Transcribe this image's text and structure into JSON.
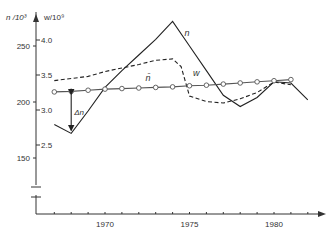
{
  "chart_data": {
    "type": "line",
    "title": "",
    "xlabel": "",
    "ylabel_left": "n /10³",
    "ylabel_right": "w/10⁹",
    "x_ticks": [
      1970,
      1975,
      1980
    ],
    "x_range": [
      1967,
      1983
    ],
    "y_left_ticks": [
      150,
      200,
      250
    ],
    "y_left_range": [
      130,
      275
    ],
    "y_right_ticks": [
      "2.5",
      "3.0",
      "3.5",
      "4.0"
    ],
    "axis_break": true,
    "grid": false,
    "legend": "inline labels",
    "series": [
      {
        "name": "n",
        "label": "n",
        "style": "solid",
        "axis": "left",
        "x": [
          1967,
          1968,
          1969,
          1970,
          1971,
          1972,
          1973,
          1974,
          1975,
          1976,
          1977,
          1978,
          1979,
          1980,
          1981,
          1982
        ],
        "values": [
          180,
          172,
          192,
          213,
          228,
          242,
          256,
          272,
          250,
          228,
          206,
          196,
          204,
          218,
          217,
          202
        ]
      },
      {
        "name": "w",
        "label": "w",
        "style": "dashed",
        "axis": "right",
        "x": [
          1967,
          1968,
          1969,
          1970,
          1971,
          1972,
          1973,
          1974,
          1974.5,
          1975,
          1976,
          1977,
          1978,
          1979,
          1980,
          1981
        ],
        "values": [
          3.42,
          3.45,
          3.48,
          3.55,
          3.6,
          3.65,
          3.71,
          3.73,
          3.62,
          3.2,
          3.12,
          3.1,
          3.16,
          3.25,
          3.4,
          3.36
        ]
      },
      {
        "name": "n_bar",
        "label": "n̄",
        "style": "solid-with-circles",
        "axis": "left",
        "x": [
          1967,
          1968,
          1969,
          1970,
          1971,
          1972,
          1973,
          1974,
          1975,
          1976,
          1977,
          1978,
          1979,
          1980,
          1981
        ],
        "values": [
          209,
          209.5,
          210.5,
          211.5,
          212,
          212.5,
          213,
          213.5,
          214.5,
          215,
          216,
          217,
          218,
          219,
          220
        ]
      }
    ],
    "annotations": [
      {
        "text": "Δn",
        "x": 1968,
        "from": 172,
        "to": 209.5,
        "type": "double-arrow"
      }
    ]
  }
}
